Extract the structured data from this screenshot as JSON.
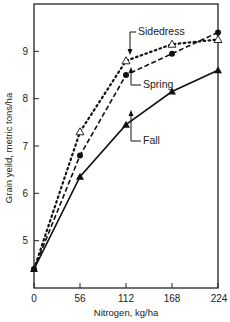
{
  "chart_data": {
    "type": "line",
    "title": "",
    "xlabel": "Nitrogen, kg/ha",
    "ylabel": "Grain yeild, metric tons/ha",
    "x": [
      0,
      56,
      112,
      168,
      224
    ],
    "xticks": [
      "0",
      "56",
      "112",
      "168",
      "224"
    ],
    "yticks": [
      "5",
      "6",
      "7",
      "8",
      "9"
    ],
    "xlim": [
      0,
      224
    ],
    "ylim": [
      4.0,
      10.0
    ],
    "grid": false,
    "legend_position": "inline annotations with arrows",
    "series": [
      {
        "name": "Sidedress",
        "style": "dotted",
        "marker": "open-triangle",
        "values": [
          4.4,
          7.3,
          8.8,
          9.15,
          9.25
        ]
      },
      {
        "name": "Spring",
        "style": "dashed",
        "marker": "filled-circle",
        "values": [
          4.4,
          6.8,
          8.5,
          8.95,
          9.4
        ]
      },
      {
        "name": "Fall",
        "style": "solid",
        "marker": "filled-triangle",
        "values": [
          4.4,
          6.35,
          7.45,
          8.15,
          8.6
        ]
      }
    ]
  }
}
